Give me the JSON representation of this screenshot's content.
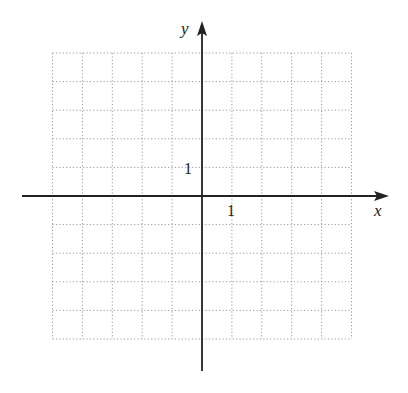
{
  "chart_data": {
    "type": "line",
    "title": "",
    "xlabel": "x",
    "ylabel": "y",
    "xlim": [
      -5,
      5
    ],
    "ylim": [
      -5,
      5
    ],
    "grid": true,
    "grid_style": "dotted",
    "tick_labels": {
      "x": [
        "1"
      ],
      "y": [
        "1"
      ]
    },
    "series": []
  },
  "labels": {
    "x_axis": "x",
    "y_axis": "y",
    "x_unit": "1",
    "y_unit": "1"
  },
  "colors": {
    "axis": "#222222",
    "grid": "#999999"
  }
}
